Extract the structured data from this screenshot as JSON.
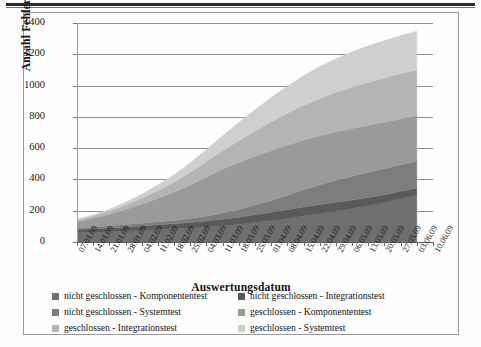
{
  "chart_data": {
    "type": "area",
    "stacked": true,
    "title": "",
    "xlabel": "Auswertungsdatum",
    "ylabel": "Anzahl Fehler",
    "ylim": [
      0,
      1400
    ],
    "ytick_step": 200,
    "yticks": [
      "0",
      "200",
      "400",
      "600",
      "800",
      "1000",
      "1200",
      "1400"
    ],
    "grid": true,
    "legend_position": "bottom",
    "categories": [
      "07.01.09",
      "14.01.09",
      "21.01.09",
      "28.01.09",
      "04.02.09",
      "11.02.09",
      "18.02.09",
      "25.02.09",
      "04.03.09",
      "11.03.09",
      "18.03.09",
      "25.03.09",
      "01.04.09",
      "08.04.09",
      "15.04.09",
      "22.04.09",
      "29.04.09",
      "06.05.09",
      "13.05.09",
      "20.05.09",
      "27.05.09",
      "03.06.09",
      "10.06.09"
    ],
    "series": [
      {
        "name": "nicht geschlossen - Komponententest",
        "color": "#6f6f6f",
        "values": [
          60,
          62,
          66,
          70,
          74,
          80,
          84,
          90,
          96,
          104,
          112,
          124,
          136,
          150,
          166,
          182,
          198,
          214,
          232,
          252,
          276,
          300,
          null
        ]
      },
      {
        "name": "nicht geschlossen - Integrationstest",
        "color": "#5a5a5a",
        "values": [
          20,
          22,
          24,
          26,
          28,
          30,
          32,
          34,
          38,
          42,
          46,
          50,
          54,
          56,
          58,
          58,
          56,
          54,
          52,
          50,
          48,
          46,
          null
        ]
      },
      {
        "name": "nicht geschlossen - Systemtest",
        "color": "#7d7d7d",
        "values": [
          10,
          12,
          14,
          16,
          18,
          20,
          22,
          26,
          32,
          40,
          50,
          62,
          76,
          92,
          110,
          126,
          140,
          152,
          160,
          166,
          170,
          172,
          null
        ]
      },
      {
        "name": "geschlossen - Komponententest",
        "color": "#9a9a9a",
        "values": [
          40,
          56,
          74,
          96,
          122,
          150,
          180,
          214,
          250,
          280,
          300,
          312,
          318,
          320,
          318,
          314,
          310,
          306,
          302,
          298,
          294,
          290,
          null
        ]
      },
      {
        "name": "geschlossen - Integrationstest",
        "color": "#b4b4b4",
        "values": [
          10,
          14,
          20,
          28,
          38,
          50,
          64,
          80,
          98,
          118,
          140,
          162,
          184,
          204,
          222,
          238,
          252,
          264,
          274,
          282,
          288,
          292,
          null
        ]
      },
      {
        "name": "geschlossen - Systemtest",
        "color": "#cfcfcf",
        "values": [
          5,
          8,
          12,
          18,
          26,
          36,
          48,
          62,
          78,
          96,
          116,
          136,
          156,
          174,
          190,
          204,
          216,
          226,
          234,
          240,
          244,
          248,
          null
        ]
      }
    ]
  },
  "legend": {
    "items": [
      {
        "label": "nicht geschlossen - Komponententest",
        "color": "#6f6f6f"
      },
      {
        "label": "nicht geschlossen - Integrationstest",
        "color": "#5a5a5a"
      },
      {
        "label": "nicht geschlossen - Systemtest",
        "color": "#7d7d7d"
      },
      {
        "label": "geschlossen - Komponententest",
        "color": "#9a9a9a"
      },
      {
        "label": "geschlossen - Integrationstest",
        "color": "#b4b4b4"
      },
      {
        "label": "geschlossen - Systemtest",
        "color": "#cfcfcf"
      }
    ]
  }
}
